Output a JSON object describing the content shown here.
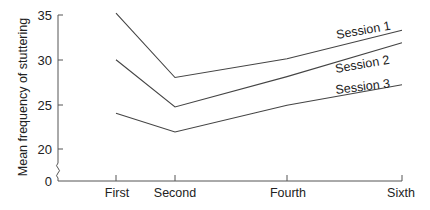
{
  "chart_data": {
    "type": "line",
    "title": "",
    "xlabel": "",
    "ylabel": "Mean frequency of stuttering",
    "categories": [
      "First",
      "Second",
      "Fourth",
      "Sixth"
    ],
    "y_ticks": [
      "35",
      "30",
      "25",
      "20",
      "0"
    ],
    "ylim": [
      0,
      35
    ],
    "axis_break": true,
    "grid": false,
    "legend": "inline labels at line ends",
    "series": [
      {
        "name": "Session 1",
        "values": [
          35.2,
          28.0,
          30.1,
          33.3
        ]
      },
      {
        "name": "Session 2",
        "values": [
          30.0,
          24.7,
          28.1,
          31.9
        ]
      },
      {
        "name": "Session 3",
        "values": [
          24.0,
          21.9,
          24.9,
          27.2
        ]
      }
    ]
  }
}
